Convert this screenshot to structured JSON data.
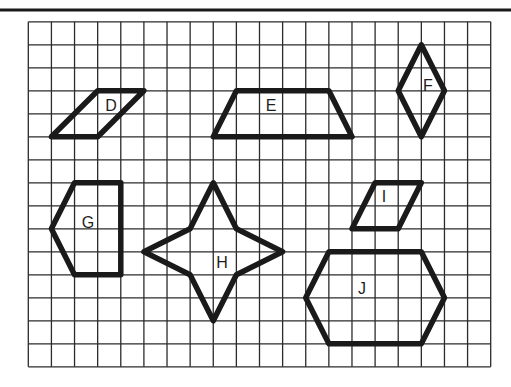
{
  "figure": {
    "grid": {
      "origin_px": [
        28.3,
        21.8
      ],
      "cell_w_px": 23.12,
      "cell_h_px": 23.0,
      "cols": 20,
      "rows": 15,
      "line_color": "#2b2b2b"
    },
    "top_rule": {
      "y_px": 10,
      "x1_px": 0,
      "x2_px": 511,
      "color": "#1a1a1a"
    },
    "stroke_color": "#1a1a1a",
    "shapes": [
      {
        "label": "D",
        "kind": "parallelogram",
        "vertices": [
          [
            3,
            3
          ],
          [
            5,
            3
          ],
          [
            3,
            5
          ],
          [
            1,
            5
          ]
        ],
        "label_pos_px": [
          111,
          105
        ]
      },
      {
        "label": "E",
        "kind": "trapezoid",
        "vertices": [
          [
            9,
            3
          ],
          [
            13,
            3
          ],
          [
            14,
            5
          ],
          [
            8,
            5
          ]
        ],
        "label_pos_px": [
          271,
          105
        ]
      },
      {
        "label": "F",
        "kind": "rhombus",
        "vertices": [
          [
            17,
            1
          ],
          [
            18,
            3
          ],
          [
            17,
            5
          ],
          [
            16,
            3
          ]
        ],
        "label_pos_px": [
          428,
          85
        ]
      },
      {
        "label": "G",
        "kind": "pentagon",
        "vertices": [
          [
            2,
            7
          ],
          [
            4,
            7
          ],
          [
            4,
            11
          ],
          [
            2,
            11
          ],
          [
            1,
            9
          ]
        ],
        "label_pos_px": [
          88,
          222
        ]
      },
      {
        "label": "H",
        "kind": "four-pointed star",
        "vertices": [
          [
            8,
            7
          ],
          [
            9,
            9
          ],
          [
            11,
            10
          ],
          [
            9,
            11
          ],
          [
            8,
            13
          ],
          [
            7,
            11
          ],
          [
            5,
            10
          ],
          [
            7,
            9
          ]
        ],
        "label_pos_px": [
          222,
          262
        ]
      },
      {
        "label": "I",
        "kind": "parallelogram",
        "vertices": [
          [
            15,
            7
          ],
          [
            17,
            7
          ],
          [
            16,
            9
          ],
          [
            14,
            9
          ]
        ],
        "label_pos_px": [
          384,
          196
        ]
      },
      {
        "label": "J",
        "kind": "hexagon",
        "vertices": [
          [
            13,
            10
          ],
          [
            17,
            10
          ],
          [
            18,
            12
          ],
          [
            17,
            14
          ],
          [
            13,
            14
          ],
          [
            12,
            12
          ]
        ],
        "label_pos_px": [
          362,
          288
        ]
      }
    ]
  }
}
